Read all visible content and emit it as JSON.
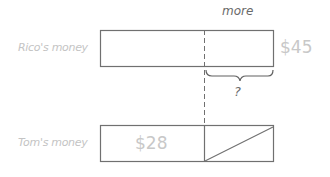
{
  "diagram": {
    "rows": [
      {
        "label": "Rico's money",
        "value": "$45"
      },
      {
        "label": "Tom's money",
        "value": "$28"
      }
    ],
    "top_annotation": "more",
    "unknown_marker": "?"
  }
}
